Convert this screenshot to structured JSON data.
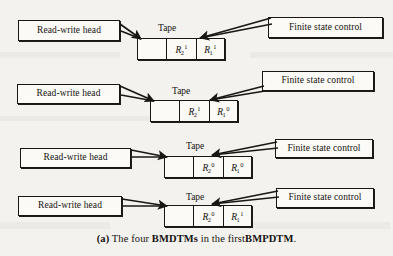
{
  "figure": {
    "caption_prefix": "(a)",
    "caption_text_1": "The four",
    "caption_bold_1": "BMDTMs",
    "caption_text_2": "in the first",
    "caption_bold_2": "BMPDTM",
    "caption_end": ".",
    "caption_full": "(a) The four BMDTMs in the first BMPDTM."
  },
  "labels": {
    "read_write_head": "Read-write head",
    "finite_state_control": "Finite state control",
    "tape": "Tape"
  },
  "rows": [
    {
      "id": "bmdtm-1",
      "head_label": "Read-write head",
      "control_label": "Finite state control",
      "tape_label": "Tape",
      "cells": [
        {
          "base": "",
          "sub": "",
          "sup": ""
        },
        {
          "base": "R",
          "sub": "2",
          "sup": "1"
        },
        {
          "base": "R",
          "sub": "1",
          "sup": "1"
        }
      ]
    },
    {
      "id": "bmdtm-2",
      "head_label": "Read-write head",
      "control_label": "Finite state control",
      "tape_label": "Tape",
      "cells": [
        {
          "base": "",
          "sub": "",
          "sup": ""
        },
        {
          "base": "R",
          "sub": "2",
          "sup": "1"
        },
        {
          "base": "R",
          "sub": "1",
          "sup": "0"
        }
      ]
    },
    {
      "id": "bmdtm-3",
      "head_label": "Read-write head",
      "control_label": "Finite state control",
      "tape_label": "Tape",
      "cells": [
        {
          "base": "",
          "sub": "",
          "sup": ""
        },
        {
          "base": "R",
          "sub": "2",
          "sup": "0"
        },
        {
          "base": "R",
          "sub": "1",
          "sup": "0"
        }
      ]
    },
    {
      "id": "bmdtm-4",
      "head_label": "Read-write head",
      "control_label": "Finite state control",
      "tape_label": "Tape",
      "cells": [
        {
          "base": "",
          "sub": "",
          "sup": ""
        },
        {
          "base": "R",
          "sub": "2",
          "sup": "0"
        },
        {
          "base": "R",
          "sub": "1",
          "sup": "1"
        }
      ]
    }
  ],
  "colors": {
    "background": "#f3f2ee",
    "box_fill": "#fbfaf7",
    "ink": "#1a1713"
  }
}
